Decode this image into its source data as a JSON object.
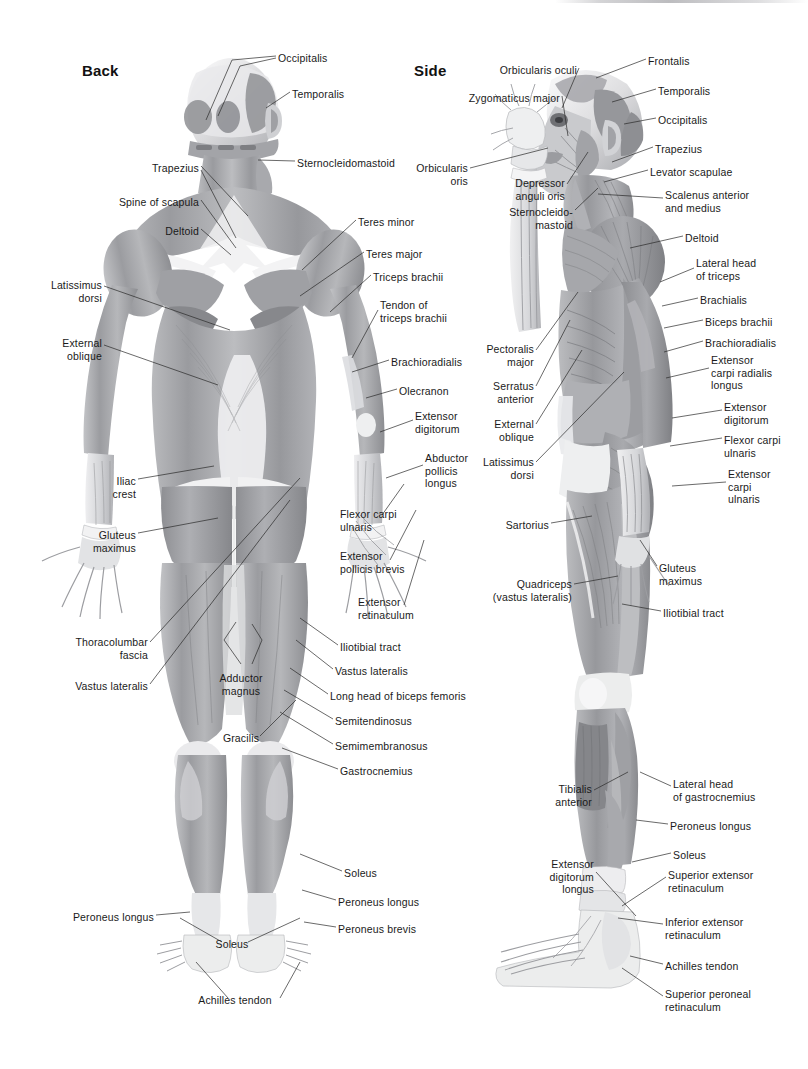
{
  "document": {
    "title": "Muscular System — Back and Side Views",
    "background_color": "#ffffff",
    "text_color": "#1a1a1a",
    "leader_line_color": "#2a2a2a",
    "width": 808,
    "height": 1069
  },
  "views": [
    {
      "id": "back",
      "title": "Back"
    },
    {
      "id": "side",
      "title": "Side"
    }
  ],
  "back_view": {
    "title": "Back",
    "labels": [
      {
        "id": "occipitalis",
        "text": "Occipitalis",
        "x": 278,
        "y": 52,
        "align": "left"
      },
      {
        "id": "temporalis",
        "text": "Temporalis",
        "x": 292,
        "y": 88,
        "align": "left"
      },
      {
        "id": "sternocleidomastoid",
        "text": "Sternocleidomastoid",
        "x": 297,
        "y": 157,
        "align": "left"
      },
      {
        "id": "trapezius",
        "text": "Trapezius",
        "x": 199,
        "y": 162,
        "align": "right"
      },
      {
        "id": "spine-of-scapula",
        "text": "Spine of scapula",
        "x": 199,
        "y": 196,
        "align": "right"
      },
      {
        "id": "deltoid",
        "text": "Deltoid",
        "x": 199,
        "y": 225,
        "align": "right"
      },
      {
        "id": "latissimus-dorsi",
        "text": "Latissimus\ndorsi",
        "x": 102,
        "y": 279,
        "align": "right"
      },
      {
        "id": "external-oblique",
        "text": "External\noblique",
        "x": 102,
        "y": 337,
        "align": "right"
      },
      {
        "id": "iliac-crest",
        "text": "Iliac\ncrest",
        "x": 136,
        "y": 475,
        "align": "right"
      },
      {
        "id": "gluteus-maximus",
        "text": "Gluteus\nmaximus",
        "x": 136,
        "y": 529,
        "align": "right"
      },
      {
        "id": "thoracolumbar-fascia",
        "text": "Thoracolumbar\nfascia",
        "x": 148,
        "y": 636,
        "align": "right"
      },
      {
        "id": "vastus-lateralis-l",
        "text": "Vastus lateralis",
        "x": 148,
        "y": 680,
        "align": "right"
      },
      {
        "id": "teres-minor",
        "text": "Teres minor",
        "x": 358,
        "y": 216,
        "align": "left"
      },
      {
        "id": "teres-major",
        "text": "Teres major",
        "x": 366,
        "y": 248,
        "align": "left"
      },
      {
        "id": "triceps-brachii",
        "text": "Triceps brachii",
        "x": 373,
        "y": 271,
        "align": "left"
      },
      {
        "id": "tendon-triceps",
        "text": "Tendon of\ntriceps brachii",
        "x": 380,
        "y": 299,
        "align": "left"
      },
      {
        "id": "brachioradialis",
        "text": "Brachioradialis",
        "x": 391,
        "y": 356,
        "align": "left"
      },
      {
        "id": "olecranon",
        "text": "Olecranon",
        "x": 399,
        "y": 385,
        "align": "left"
      },
      {
        "id": "extensor-digitorum",
        "text": "Extensor\ndigitorum",
        "x": 415,
        "y": 410,
        "align": "left"
      },
      {
        "id": "abductor-pollicis",
        "text": "Abductor\npollicis\nlongus",
        "x": 425,
        "y": 452,
        "align": "left"
      },
      {
        "id": "flexor-carpi-ulnaris",
        "text": "Flexor carpi\nulnaris",
        "x": 340,
        "y": 508,
        "align": "left"
      },
      {
        "id": "extensor-pollicis",
        "text": "Extensor\npollicis brevis",
        "x": 340,
        "y": 550,
        "align": "left"
      },
      {
        "id": "extensor-retinaculum",
        "text": "Extensor\nretinaculum",
        "x": 358,
        "y": 596,
        "align": "left"
      },
      {
        "id": "iliotibial-tract",
        "text": "Iliotibial tract",
        "x": 340,
        "y": 641,
        "align": "left"
      },
      {
        "id": "vastus-lateralis-r",
        "text": "Vastus lateralis",
        "x": 335,
        "y": 665,
        "align": "left"
      },
      {
        "id": "long-head-biceps",
        "text": "Long head of biceps femoris",
        "x": 330,
        "y": 690,
        "align": "left"
      },
      {
        "id": "semitendinosus",
        "text": "Semitendinosus",
        "x": 335,
        "y": 715,
        "align": "left"
      },
      {
        "id": "semimembranosus",
        "text": "Semimembranosus",
        "x": 335,
        "y": 740,
        "align": "left"
      },
      {
        "id": "gastrocnemius",
        "text": "Gastrocnemius",
        "x": 340,
        "y": 765,
        "align": "left"
      },
      {
        "id": "adductor-magnus",
        "text": "Adductor\nmagnus",
        "x": 241,
        "y": 672,
        "align": "center"
      },
      {
        "id": "gracilis",
        "text": "Gracilis",
        "x": 241,
        "y": 732,
        "align": "center"
      },
      {
        "id": "soleus-r",
        "text": "Soleus",
        "x": 344,
        "y": 867,
        "align": "left"
      },
      {
        "id": "peroneus-longus-r",
        "text": "Peroneus longus",
        "x": 338,
        "y": 896,
        "align": "left"
      },
      {
        "id": "peroneus-brevis",
        "text": "Peroneus brevis",
        "x": 338,
        "y": 923,
        "align": "left"
      },
      {
        "id": "peroneus-longus-l",
        "text": "Peroneus longus",
        "x": 154,
        "y": 911,
        "align": "right"
      },
      {
        "id": "soleus-c",
        "text": "Soleus",
        "x": 232,
        "y": 938,
        "align": "center"
      },
      {
        "id": "achilles-tendon",
        "text": "Achilles tendon",
        "x": 235,
        "y": 994,
        "align": "center"
      }
    ]
  },
  "side_view": {
    "title": "Side",
    "labels": [
      {
        "id": "frontalis",
        "text": "Frontalis",
        "x": 648,
        "y": 55,
        "align": "left"
      },
      {
        "id": "temporalis-s",
        "text": "Temporalis",
        "x": 658,
        "y": 85,
        "align": "left"
      },
      {
        "id": "occipitalis-s",
        "text": "Occipitalis",
        "x": 658,
        "y": 114,
        "align": "left"
      },
      {
        "id": "trapezius-s",
        "text": "Trapezius",
        "x": 655,
        "y": 143,
        "align": "left"
      },
      {
        "id": "levator-scapulae",
        "text": "Levator scapulae",
        "x": 650,
        "y": 166,
        "align": "left"
      },
      {
        "id": "scalenus",
        "text": "Scalenus anterior\nand medius",
        "x": 665,
        "y": 189,
        "align": "left"
      },
      {
        "id": "deltoid-s",
        "text": "Deltoid",
        "x": 685,
        "y": 232,
        "align": "left"
      },
      {
        "id": "lateral-head-triceps",
        "text": "Lateral head\nof triceps",
        "x": 696,
        "y": 257,
        "align": "left"
      },
      {
        "id": "brachialis",
        "text": "Brachialis",
        "x": 700,
        "y": 294,
        "align": "left"
      },
      {
        "id": "biceps-brachii",
        "text": "Biceps brachii",
        "x": 705,
        "y": 316,
        "align": "left"
      },
      {
        "id": "brachioradialis-s",
        "text": "Brachioradialis",
        "x": 705,
        "y": 337,
        "align": "left"
      },
      {
        "id": "extensor-carpi-rad",
        "text": "Extensor\ncarpi radialis\nlongus",
        "x": 711,
        "y": 354,
        "align": "left"
      },
      {
        "id": "extensor-digitorum-s",
        "text": "Extensor\ndigitorum",
        "x": 724,
        "y": 401,
        "align": "left"
      },
      {
        "id": "flexor-carpi-ulnaris-s",
        "text": "Flexor carpi\nulnaris",
        "x": 724,
        "y": 434,
        "align": "left"
      },
      {
        "id": "extensor-carpi-ulnaris",
        "text": "Extensor\ncarpi\nulnaris",
        "x": 728,
        "y": 468,
        "align": "left"
      },
      {
        "id": "orbicularis-oculi",
        "text": "Orbicularis oculi",
        "x": 577,
        "y": 64,
        "align": "right"
      },
      {
        "id": "zygomaticus-major",
        "text": "Zygomaticus major",
        "x": 560,
        "y": 92,
        "align": "right"
      },
      {
        "id": "orbicularis-oris",
        "text": "Orbicularis\noris",
        "x": 468,
        "y": 162,
        "align": "right"
      },
      {
        "id": "depressor-anguli",
        "text": "Depressor\nanguli oris",
        "x": 565,
        "y": 177,
        "align": "right"
      },
      {
        "id": "sternocleidomastoid-s",
        "text": "Sternocleido-\nmastoid",
        "x": 573,
        "y": 206,
        "align": "right"
      },
      {
        "id": "pectoralis-major",
        "text": "Pectoralis\nmajor",
        "x": 534,
        "y": 343,
        "align": "right"
      },
      {
        "id": "serratus-anterior",
        "text": "Serratus\nanterior",
        "x": 534,
        "y": 380,
        "align": "right"
      },
      {
        "id": "external-oblique-s",
        "text": "External\noblique",
        "x": 534,
        "y": 418,
        "align": "right"
      },
      {
        "id": "latissimus-dorsi-s",
        "text": "Latissimus\ndorsi",
        "x": 534,
        "y": 456,
        "align": "right"
      },
      {
        "id": "sartorius",
        "text": "Sartorius",
        "x": 549,
        "y": 519,
        "align": "right"
      },
      {
        "id": "quadriceps",
        "text": "Quadriceps\n(vastus lateralis)",
        "x": 572,
        "y": 578,
        "align": "right"
      },
      {
        "id": "gluteus-maximus-s",
        "text": "Gluteus\nmaximus",
        "x": 659,
        "y": 562,
        "align": "left"
      },
      {
        "id": "iliotibial-tract-s",
        "text": "Iliotibial tract",
        "x": 663,
        "y": 607,
        "align": "left"
      },
      {
        "id": "lateral-head-gastro",
        "text": "Lateral head\nof gastrocnemius",
        "x": 673,
        "y": 778,
        "align": "left"
      },
      {
        "id": "peroneus-longus-s",
        "text": "Peroneus longus",
        "x": 670,
        "y": 820,
        "align": "left"
      },
      {
        "id": "soleus-s",
        "text": "Soleus",
        "x": 673,
        "y": 849,
        "align": "left"
      },
      {
        "id": "superior-ext-ret",
        "text": "Superior extensor\nretinaculum",
        "x": 668,
        "y": 869,
        "align": "left"
      },
      {
        "id": "inferior-ext-ret",
        "text": "Inferior extensor\nretinaculum",
        "x": 665,
        "y": 916,
        "align": "left"
      },
      {
        "id": "achilles-tendon-s",
        "text": "Achilles tendon",
        "x": 665,
        "y": 960,
        "align": "left"
      },
      {
        "id": "superior-peroneal",
        "text": "Superior peroneal\nretinaculum",
        "x": 665,
        "y": 988,
        "align": "left"
      },
      {
        "id": "tibialis-anterior",
        "text": "Tibialis\nanterior",
        "x": 592,
        "y": 783,
        "align": "right"
      },
      {
        "id": "extensor-dig-longus",
        "text": "Extensor\ndigitorum\nlongus",
        "x": 594,
        "y": 858,
        "align": "right"
      }
    ]
  }
}
